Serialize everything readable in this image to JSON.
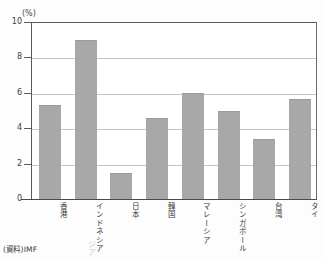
{
  "page": {
    "top_cut_text": "",
    "source_note": "(資料)IMF",
    "artifact_text": "ジア"
  },
  "chart_data": {
    "type": "bar",
    "title": "",
    "subtitle": "",
    "xlabel": "",
    "ylabel": "",
    "unit_label": "(%)",
    "categories": [
      "香港",
      "インドネシア",
      "日本",
      "韓国",
      "マレーシア",
      "シンガポール",
      "台湾",
      "タイ"
    ],
    "values": [
      5.3,
      9.0,
      1.45,
      4.6,
      6.0,
      5.0,
      3.4,
      5.65
    ],
    "ylim": [
      0,
      10
    ],
    "ytick_values": [
      0,
      2,
      4,
      6,
      8,
      10
    ],
    "ytick_labels": [
      "0",
      "2",
      "4",
      "6",
      "8",
      "10"
    ],
    "grid": true,
    "gridline_values": [
      2,
      4,
      6,
      8
    ],
    "legend": [],
    "legend_position": "none",
    "bar_color": "#a8a8a8",
    "axis_color": "#4a4a4a",
    "grid_color": "#c4c4c4",
    "annotations": []
  }
}
